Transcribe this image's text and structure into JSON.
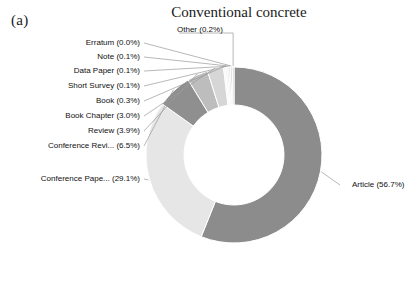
{
  "panel": {
    "label": "(a)"
  },
  "chart_data": {
    "type": "pie",
    "variant": "donut",
    "title": "Conventional concrete",
    "xlabel": "",
    "ylabel": "",
    "legend_position": "none",
    "grid": false,
    "label_format": "{name} ({value}%)",
    "categories": [
      "Article",
      "Conference Pape...",
      "Conference Revi...",
      "Review",
      "Book Chapter",
      "Book",
      "Short Survey",
      "Data Paper",
      "Note",
      "Erratum",
      "Other"
    ],
    "values": [
      56.7,
      29.1,
      6.5,
      3.9,
      3.0,
      0.3,
      0.1,
      0.1,
      0.1,
      0.0,
      0.2
    ],
    "colors": [
      "#8c8c8c",
      "#e6e6e6",
      "#8f8f8f",
      "#bdbdbd",
      "#d6d6d6",
      "#f2f2f2",
      "#ededed",
      "#e2e2e2",
      "#d8d8d8",
      "#cfcfcf",
      "#c7c7c7"
    ],
    "labels": [
      "Article (56.7%)",
      "Conference Pape... (29.1%)",
      "Conference Revi... (6.5%)",
      "Review (3.9%)",
      "Book Chapter (3.0%)",
      "Book (0.3%)",
      "Short Survey (0.1%)",
      "Data Paper (0.1%)",
      "Note (0.1%)",
      "Erratum (0.0%)",
      "Other (0.2%)"
    ]
  },
  "geometry": {
    "cx": 234,
    "cy": 155,
    "outer_r": 88,
    "inner_r": 50,
    "start_angle_deg": -90
  },
  "label_positions": [
    {
      "name": "Article",
      "x": 352,
      "y": 185,
      "align": "left"
    },
    {
      "name": "Conference Pape...",
      "x": 140,
      "y": 179,
      "align": "right"
    },
    {
      "name": "Conference Revi...",
      "x": 140,
      "y": 146,
      "align": "right"
    },
    {
      "name": "Review",
      "x": 140,
      "y": 131,
      "align": "right"
    },
    {
      "name": "Book Chapter",
      "x": 140,
      "y": 116,
      "align": "right"
    },
    {
      "name": "Book",
      "x": 140,
      "y": 101,
      "align": "right"
    },
    {
      "name": "Short Survey",
      "x": 140,
      "y": 86,
      "align": "right"
    },
    {
      "name": "Data Paper",
      "x": 140,
      "y": 71,
      "align": "right"
    },
    {
      "name": "Note",
      "x": 140,
      "y": 57,
      "align": "right"
    },
    {
      "name": "Erratum",
      "x": 140,
      "y": 43,
      "align": "right"
    },
    {
      "name": "Other",
      "x": 177,
      "y": 30,
      "align": "left"
    }
  ]
}
